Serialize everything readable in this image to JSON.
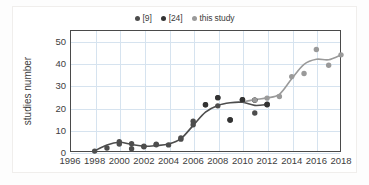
{
  "chart_data": {
    "type": "scatter",
    "title": "",
    "xlabel": "",
    "ylabel": "studies number",
    "xlim": [
      1996,
      2018
    ],
    "ylim": [
      0,
      55
    ],
    "yticks": [
      0,
      10,
      20,
      30,
      40,
      50
    ],
    "xticks": [
      1996,
      1998,
      2000,
      2002,
      2004,
      2006,
      2008,
      2010,
      2012,
      2014,
      2016,
      2018
    ],
    "grid": true,
    "legend_position": "top-center",
    "colors": {
      "ref9": "#4d4d4d",
      "ref24": "#333333",
      "this_study": "#9a9a9a",
      "gridline": "#d6e3ef",
      "axis": "#4a4a4a",
      "text": "#3d3d3d"
    },
    "series": [
      {
        "name": "[9]",
        "color": "#4d4d4d",
        "points": [
          {
            "x": 1998,
            "y": 0.4
          },
          {
            "x": 1999,
            "y": 1.8
          },
          {
            "x": 2000,
            "y": 4.6
          },
          {
            "x": 2000,
            "y": 3.6
          },
          {
            "x": 2001,
            "y": 3.7
          },
          {
            "x": 2001,
            "y": 1.5
          },
          {
            "x": 2002,
            "y": 2.4
          },
          {
            "x": 2002,
            "y": 2.6
          },
          {
            "x": 2003,
            "y": 3.3
          },
          {
            "x": 2003,
            "y": 3.5
          },
          {
            "x": 2004,
            "y": 3.2
          },
          {
            "x": 2005,
            "y": 5.8
          },
          {
            "x": 2005,
            "y": 6.3
          },
          {
            "x": 2006,
            "y": 12.3
          },
          {
            "x": 2006,
            "y": 13.9
          },
          {
            "x": 2007,
            "y": 21.3
          },
          {
            "x": 2008,
            "y": 20.8
          },
          {
            "x": 2008,
            "y": 24.5
          },
          {
            "x": 2009,
            "y": 14.6
          },
          {
            "x": 2009,
            "y": 14.3
          },
          {
            "x": 2010,
            "y": 23.6
          },
          {
            "x": 2010,
            "y": 23.4
          },
          {
            "x": 2011,
            "y": 23.4
          },
          {
            "x": 2011,
            "y": 17.6
          },
          {
            "x": 2012,
            "y": 21.3
          },
          {
            "x": 2012,
            "y": 21.6
          }
        ],
        "trend": [
          {
            "x": 1998,
            "y": 0.5
          },
          {
            "x": 1999,
            "y": 3.2
          },
          {
            "x": 2000,
            "y": 4.4
          },
          {
            "x": 2001,
            "y": 3.4
          },
          {
            "x": 2002,
            "y": 2.6
          },
          {
            "x": 2003,
            "y": 2.9
          },
          {
            "x": 2004,
            "y": 3.6
          },
          {
            "x": 2005,
            "y": 6.0
          },
          {
            "x": 2006,
            "y": 12.0
          },
          {
            "x": 2007,
            "y": 18.0
          },
          {
            "x": 2008,
            "y": 21.0
          },
          {
            "x": 2009,
            "y": 22.2
          },
          {
            "x": 2010,
            "y": 22.4
          },
          {
            "x": 2011,
            "y": 21.0
          },
          {
            "x": 2012,
            "y": 21.4
          }
        ]
      },
      {
        "name": "[24]",
        "color": "#333333",
        "points": [
          {
            "x": 2007,
            "y": 21.3
          },
          {
            "x": 2008,
            "y": 24.5
          },
          {
            "x": 2009,
            "y": 14.5
          },
          {
            "x": 2010,
            "y": 23.6
          },
          {
            "x": 2011,
            "y": 23.4
          },
          {
            "x": 2012,
            "y": 21.4
          }
        ],
        "trend": []
      },
      {
        "name": "this study",
        "color": "#9a9a9a",
        "points": [
          {
            "x": 2011,
            "y": 23.4
          },
          {
            "x": 2012,
            "y": 24.3
          },
          {
            "x": 2013,
            "y": 25.0
          },
          {
            "x": 2014,
            "y": 34.0
          },
          {
            "x": 2015,
            "y": 35.4
          },
          {
            "x": 2016,
            "y": 46.2
          },
          {
            "x": 2017,
            "y": 39.1
          },
          {
            "x": 2018,
            "y": 43.8
          }
        ],
        "trend": [
          {
            "x": 2010,
            "y": 22.6
          },
          {
            "x": 2011,
            "y": 23.6
          },
          {
            "x": 2012,
            "y": 24.4
          },
          {
            "x": 2013,
            "y": 26.0
          },
          {
            "x": 2014,
            "y": 33.0
          },
          {
            "x": 2015,
            "y": 39.5
          },
          {
            "x": 2016,
            "y": 41.8
          },
          {
            "x": 2017,
            "y": 41.6
          },
          {
            "x": 2018,
            "y": 43.8
          }
        ]
      }
    ]
  },
  "legend": {
    "items": [
      {
        "label": "[9]"
      },
      {
        "label": "[24]"
      },
      {
        "label": "this study"
      }
    ]
  },
  "axis": {
    "y_title": "studies number",
    "y_labels": [
      "50",
      "40",
      "30",
      "20",
      "10",
      "0"
    ],
    "x_labels": [
      "1996",
      "1998",
      "2000",
      "2002",
      "2004",
      "2006",
      "2008",
      "2010",
      "2012",
      "2014",
      "2016",
      "2018"
    ]
  }
}
